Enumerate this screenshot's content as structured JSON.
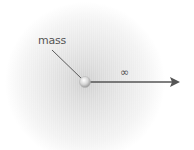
{
  "diagram": {
    "labels": {
      "mass": "mass",
      "infinity": "∞"
    },
    "elements": {
      "mass_point": {
        "cx": 85,
        "cy": 82,
        "r": 5
      },
      "leader_line": {
        "x1": 52,
        "y1": 50,
        "x2": 82,
        "y2": 79
      },
      "arrow": {
        "x1": 90,
        "y1": 82,
        "x2": 180,
        "y2": 82
      }
    },
    "colors": {
      "field_center": "#cfcfcf",
      "field_edge": "#ffffff",
      "line": "#5a5a5a",
      "arrow": "#555555",
      "sphere_highlight": "#ffffff",
      "sphere_shadow": "#9a9a9a",
      "text": "#555555"
    }
  }
}
